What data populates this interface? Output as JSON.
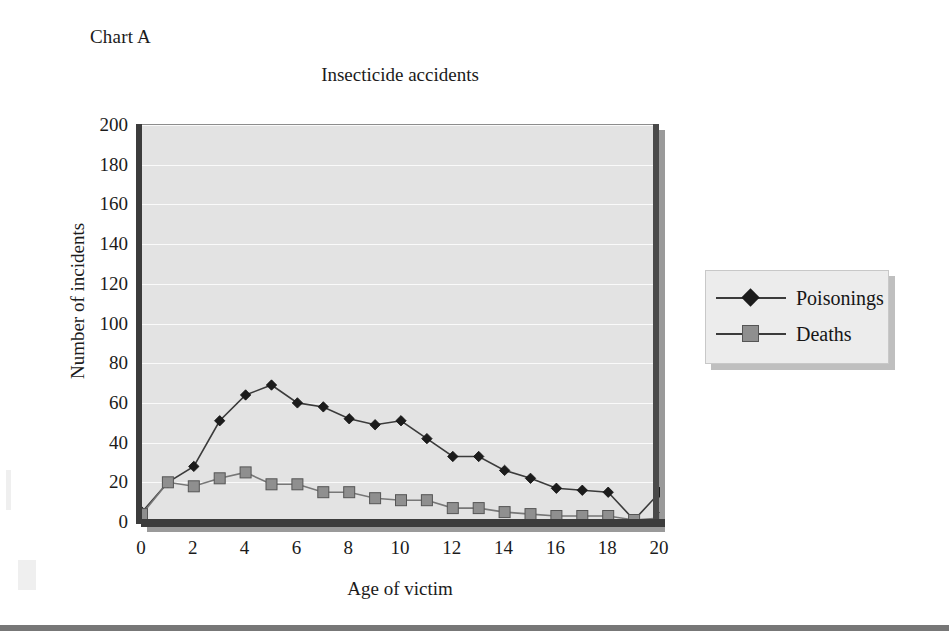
{
  "page": {
    "chart_label": "Chart A",
    "bottom_rule": true
  },
  "legend": {
    "position": "right",
    "entries": [
      {
        "label": "Poisonings",
        "marker": "diamond-marker-icon",
        "color": "#1c1c1c"
      },
      {
        "label": "Deaths",
        "marker": "square-marker-icon",
        "color": "#8f8f8f"
      }
    ]
  },
  "chart_data": {
    "type": "line",
    "title": "Insecticide accidents",
    "xlabel": "Age of victim",
    "ylabel": "Number of incidents",
    "x": [
      0,
      1,
      2,
      3,
      4,
      5,
      6,
      7,
      8,
      9,
      10,
      11,
      12,
      13,
      14,
      15,
      16,
      17,
      18,
      19,
      20
    ],
    "xlim": [
      0,
      20
    ],
    "ylim": [
      0,
      200
    ],
    "xticks": [
      0,
      2,
      4,
      6,
      8,
      10,
      12,
      14,
      16,
      18,
      20
    ],
    "yticks": [
      0,
      20,
      40,
      60,
      80,
      100,
      120,
      140,
      160,
      180,
      200
    ],
    "xtick_labels": [
      "0",
      "2",
      "4",
      "6",
      "8",
      "10",
      "12",
      "14",
      "16",
      "18",
      "20"
    ],
    "ytick_labels": [
      "0",
      "20",
      "40",
      "60",
      "80",
      "100",
      "120",
      "140",
      "160",
      "180",
      "200"
    ],
    "grid": "horizontal",
    "plot_background": "#e3e3e3",
    "gridline_color": "#fafafa",
    "series": [
      {
        "name": "Poisonings",
        "marker": "diamond",
        "color": "#1c1c1c",
        "values": [
          5,
          20,
          28,
          51,
          64,
          69,
          60,
          58,
          52,
          49,
          51,
          42,
          33,
          33,
          26,
          22,
          17,
          16,
          15,
          1,
          15
        ]
      },
      {
        "name": "Deaths",
        "marker": "square",
        "color": "#8f8f8f",
        "values": [
          4,
          20,
          18,
          22,
          25,
          19,
          19,
          15,
          15,
          12,
          11,
          11,
          7,
          7,
          5,
          4,
          3,
          3,
          3,
          1,
          2
        ]
      }
    ]
  }
}
